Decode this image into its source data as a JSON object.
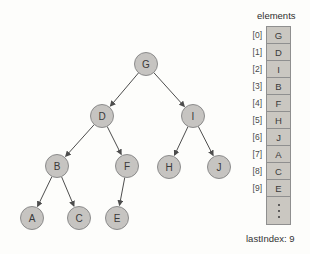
{
  "tree": {
    "nodes": [
      {
        "id": "G",
        "label": "G",
        "x": 146,
        "y": 64
      },
      {
        "id": "D",
        "label": "D",
        "x": 102,
        "y": 116
      },
      {
        "id": "I",
        "label": "I",
        "x": 193,
        "y": 116
      },
      {
        "id": "B",
        "label": "B",
        "x": 57,
        "y": 166
      },
      {
        "id": "F",
        "label": "F",
        "x": 127,
        "y": 166
      },
      {
        "id": "H",
        "label": "H",
        "x": 169,
        "y": 167
      },
      {
        "id": "J",
        "label": "J",
        "x": 219,
        "y": 167
      },
      {
        "id": "A",
        "label": "A",
        "x": 32,
        "y": 218
      },
      {
        "id": "C",
        "label": "C",
        "x": 79,
        "y": 218
      },
      {
        "id": "E",
        "label": "E",
        "x": 117,
        "y": 218
      }
    ],
    "edges": [
      [
        "G",
        "D"
      ],
      [
        "G",
        "I"
      ],
      [
        "D",
        "B"
      ],
      [
        "D",
        "F"
      ],
      [
        "I",
        "H"
      ],
      [
        "I",
        "J"
      ],
      [
        "B",
        "A"
      ],
      [
        "B",
        "C"
      ],
      [
        "F",
        "E"
      ]
    ]
  },
  "array": {
    "header": "elements",
    "rows": [
      {
        "index": "[0]",
        "value": "G"
      },
      {
        "index": "[1]",
        "value": "D"
      },
      {
        "index": "[2]",
        "value": "I"
      },
      {
        "index": "[3]",
        "value": "B"
      },
      {
        "index": "[4]",
        "value": "F"
      },
      {
        "index": "[5]",
        "value": "H"
      },
      {
        "index": "[6]",
        "value": "J"
      },
      {
        "index": "[7]",
        "value": "A"
      },
      {
        "index": "[8]",
        "value": "C"
      },
      {
        "index": "[9]",
        "value": "E"
      }
    ],
    "ellipsis_icon": "vertical-ellipsis",
    "last_index_label": "lastIndex: 9"
  },
  "colors": {
    "background": "#fdfdfb",
    "node_fill": "#c6c4c1",
    "node_border": "#8c8c8c",
    "cell_fill": "#cac7c1",
    "cell_border": "#8f8f8f",
    "edge": "#4d4d4d",
    "text": "#3a3a3a"
  }
}
